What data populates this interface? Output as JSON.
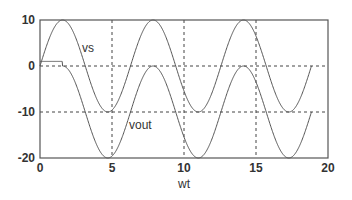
{
  "chart_data": {
    "type": "line",
    "title": "",
    "xlabel": "wt",
    "ylabel": "",
    "xlim": [
      0,
      20
    ],
    "ylim": [
      -20,
      10
    ],
    "grid": true,
    "xticks": [
      0,
      5,
      10,
      15,
      20
    ],
    "yticks": [
      10,
      0,
      -10,
      -20
    ],
    "annotations": [
      {
        "text": "vs",
        "x": 3.0,
        "y": 3.5
      },
      {
        "text": "vout",
        "x": 6.0,
        "y": -13.5
      }
    ],
    "series": [
      {
        "name": "vs",
        "function": "10*sin(wt)",
        "x_range": [
          0,
          18.85
        ],
        "amplitude": 10,
        "offset": 0
      },
      {
        "name": "vout",
        "function": "max(10*sin(wt)-10, clamp) with initial flat ~1 until wt~2",
        "x_range": [
          0,
          18.85
        ],
        "amplitude": 10,
        "offset": -10,
        "initial_flat_value": 1
      }
    ],
    "colors": {
      "curve": "#555555",
      "axes": "#555555",
      "grid": "#444444"
    }
  }
}
